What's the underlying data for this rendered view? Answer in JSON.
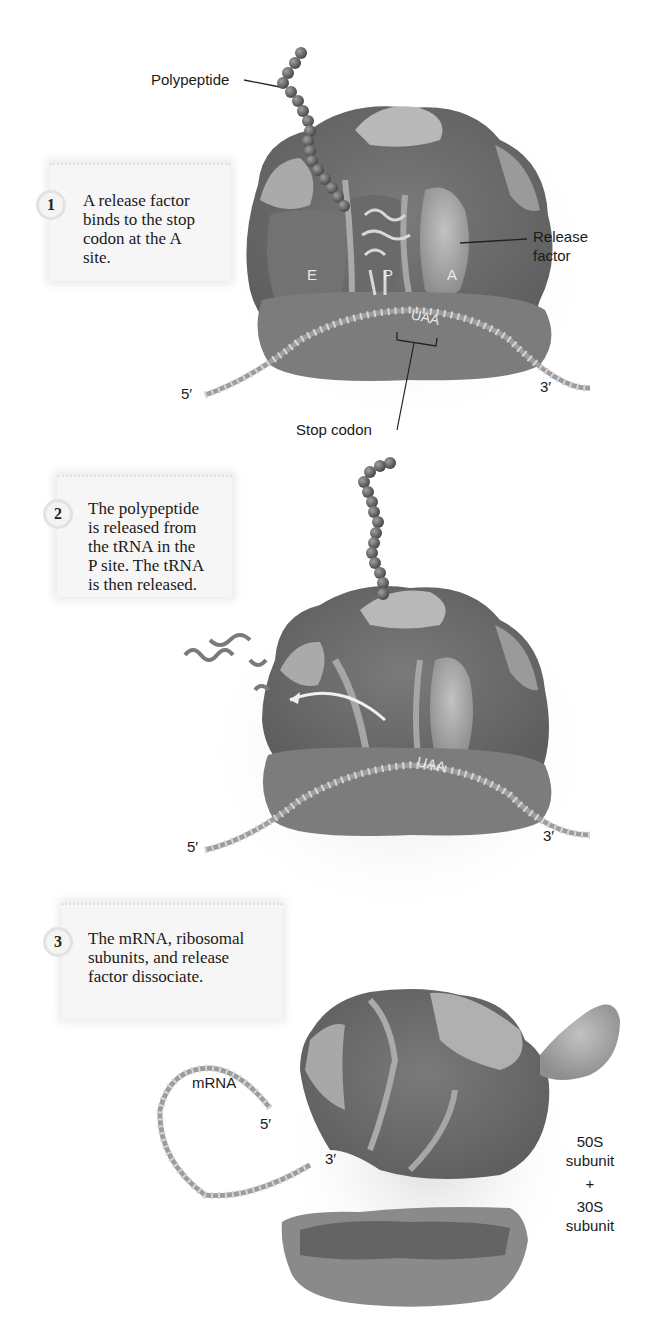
{
  "steps": [
    {
      "number": "1",
      "text_lines": [
        "A release factor",
        "binds to the stop",
        "codon at the A",
        "site."
      ],
      "labels": {
        "polypeptide": "Polypeptide",
        "release_factor_line1": "Release",
        "release_factor_line2": "factor",
        "stop_codon": "Stop codon",
        "five_prime": "5′",
        "three_prime": "3′",
        "site_e": "E",
        "site_p": "P",
        "site_a": "A",
        "codon": "UAA"
      }
    },
    {
      "number": "2",
      "text_lines": [
        "The polypeptide",
        "is released from",
        "the tRNA in the",
        "P site. The tRNA",
        "is then released."
      ],
      "labels": {
        "five_prime": "5′",
        "three_prime": "3′",
        "codon": "UAA"
      }
    },
    {
      "number": "3",
      "text_lines": [
        "The mRNA, ribosomal",
        "subunits, and release",
        "factor dissociate."
      ],
      "labels": {
        "mrna": "mRNA",
        "five_prime": "5′",
        "three_prime": "3′",
        "large_subunit_line1": "50S",
        "large_subunit_line2": "subunit",
        "plus": "+",
        "small_subunit_line1": "30S",
        "small_subunit_line2": "subunit"
      }
    }
  ],
  "colors": {
    "ribosome_dark": "#6e6e6e",
    "ribosome_mid": "#8a8a8a",
    "ribosome_light": "#b4b4b4",
    "bead": "#6a6a6a",
    "mrna": "#9a9a9a",
    "step_box": "#f6f6f6"
  }
}
